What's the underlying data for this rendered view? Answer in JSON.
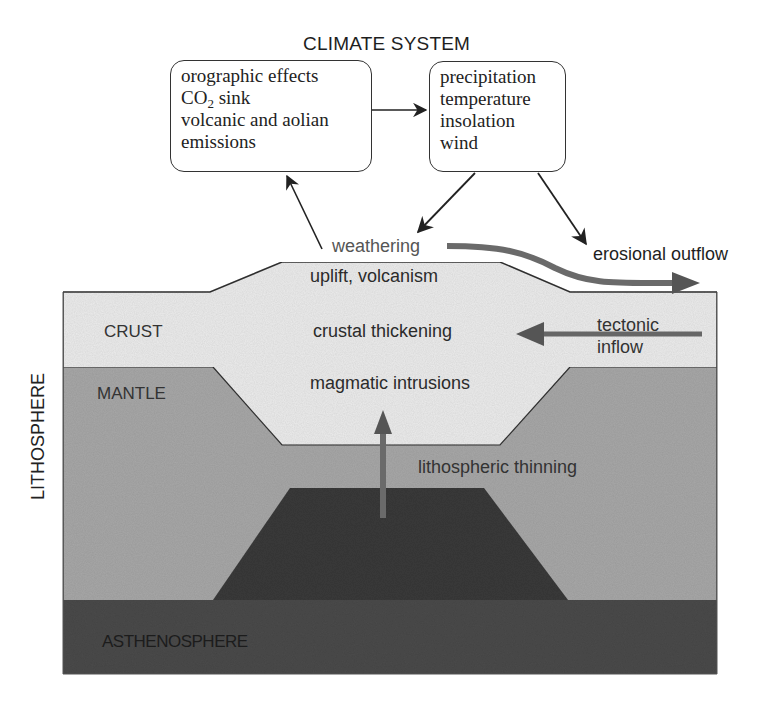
{
  "title": "CLIMATE SYSTEM",
  "climate_boxes": {
    "left": {
      "lines": [
        "orographic effects",
        "CO",
        "2",
        " sink",
        "volcanic and aolian",
        "emissions"
      ]
    },
    "right": {
      "lines": [
        "precipitation",
        "temperature",
        "insolation",
        "wind"
      ]
    }
  },
  "side_label": "LITHOSPHERE",
  "layers": {
    "crust": "CRUST",
    "mantle": "MANTLE",
    "asthenosphere": "ASTHENOSPHERE"
  },
  "processes": {
    "weathering": "weathering",
    "uplift": "uplift, volcanism",
    "crustal_thickening": "crustal thickening",
    "magmatic_intrusions": "magmatic intrusions",
    "lithospheric_thinning": "lithospheric thinning",
    "erosional_outflow": "erosional outflow",
    "tectonic_inflow_1": "tectonic",
    "tectonic_inflow_2": "inflow"
  },
  "colors": {
    "crust": "#ececec",
    "mantle": "#a9a9a9",
    "asthenosphere": "#4a4a4a",
    "asthenosphere_bump": "#3a3a3a",
    "thick_arrow": "#6e6e6e",
    "line": "#333333"
  }
}
